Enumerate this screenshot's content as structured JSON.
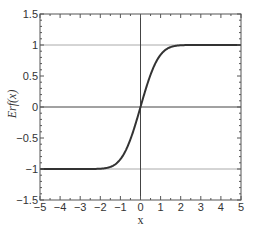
{
  "chart_data": {
    "type": "line",
    "title": "",
    "xlabel": "x",
    "ylabel": "Erf(x)",
    "xlim": [
      -5,
      5
    ],
    "ylim": [
      -1.5,
      1.5
    ],
    "x_ticks": [
      -5,
      -4,
      -3,
      -2,
      -1,
      0,
      1,
      2,
      3,
      4,
      5
    ],
    "x_tick_labels": [
      "−5",
      "−4",
      "−3",
      "−2",
      "−1",
      "0",
      "1",
      "2",
      "3",
      "4",
      "5"
    ],
    "y_ticks": [
      -1.5,
      -1,
      -0.5,
      0,
      0.5,
      1,
      1.5
    ],
    "y_tick_labels": [
      "−1.5",
      "−1",
      "−0.5",
      "0",
      "0.5",
      "1",
      "1.5"
    ],
    "reference_lines": {
      "horizontal": [
        -1,
        0,
        1
      ],
      "vertical": [
        0
      ]
    },
    "grid": false,
    "legend": null,
    "series": [
      {
        "name": "Erf(x)",
        "x": [
          -5,
          -3,
          -2,
          -1.5,
          -1,
          -0.5,
          0,
          0.5,
          1,
          1.5,
          2,
          3,
          5
        ],
        "values": [
          -1.0,
          -1.0,
          -0.995,
          -0.966,
          -0.843,
          -0.52,
          0.0,
          0.52,
          0.843,
          0.966,
          0.995,
          1.0,
          1.0
        ]
      }
    ]
  },
  "colors": {
    "curve": "#333333",
    "axes": "#555555",
    "reference_line_light": "#aaaaaa",
    "reference_line_dark": "#444444"
  }
}
